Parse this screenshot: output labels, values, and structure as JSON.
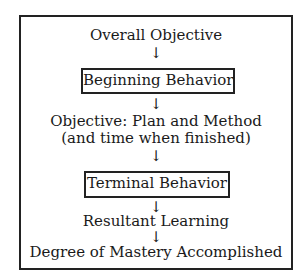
{
  "diagram": {
    "type": "flowchart",
    "nodes": [
      {
        "id": "overall_objective",
        "label": "Overall Objective",
        "boxed": false
      },
      {
        "id": "beginning_behavior",
        "label": "Beginning Behavior",
        "boxed": true
      },
      {
        "id": "objective_plan",
        "label": "Objective: Plan and Method",
        "label_line2": "(and time when finished)",
        "boxed": false
      },
      {
        "id": "terminal_behavior",
        "label": "Terminal Behavior",
        "boxed": true
      },
      {
        "id": "resultant_learning",
        "label": "Resultant Learning",
        "boxed": false
      },
      {
        "id": "degree_mastery",
        "label": "Degree of Mastery Accomplished",
        "boxed": false
      }
    ],
    "edges": [
      {
        "from": "overall_objective",
        "to": "beginning_behavior"
      },
      {
        "from": "beginning_behavior",
        "to": "objective_plan"
      },
      {
        "from": "objective_plan",
        "to": "terminal_behavior"
      },
      {
        "from": "terminal_behavior",
        "to": "resultant_learning"
      },
      {
        "from": "resultant_learning",
        "to": "degree_mastery"
      }
    ],
    "arrow_glyph": "↓"
  }
}
